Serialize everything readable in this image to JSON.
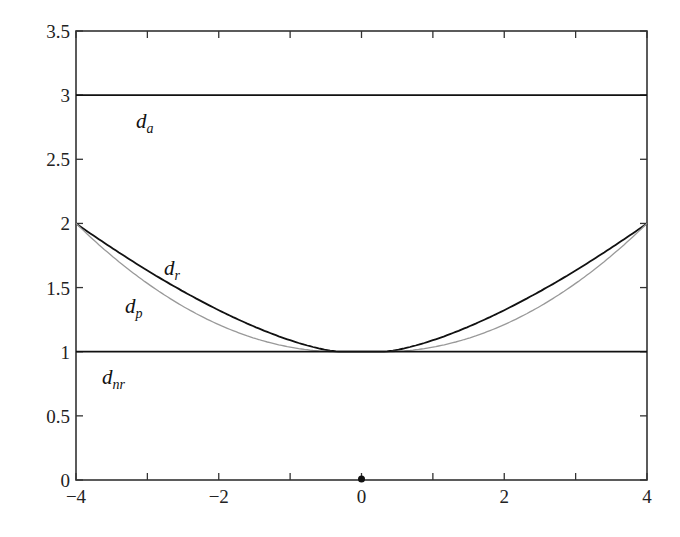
{
  "chart_data": {
    "type": "line",
    "title": "",
    "xlabel": "",
    "ylabel": "",
    "xlim": [
      -4,
      4
    ],
    "ylim": [
      0,
      3.5
    ],
    "grid": false,
    "legend": "none (inline curve labels)",
    "x_ticks": [
      -4,
      -2,
      0,
      2,
      4
    ],
    "x_tick_labels": [
      "−4",
      "−2",
      "0",
      "2",
      "4"
    ],
    "x_minor_ticks": [
      -3,
      -1,
      1,
      3
    ],
    "y_ticks": [
      0,
      0.5,
      1,
      1.5,
      2,
      2.5,
      3,
      3.5
    ],
    "y_tick_labels": [
      "0",
      "0.5",
      "1",
      "1.5",
      "2",
      "2.5",
      "3",
      "3.5"
    ],
    "series": [
      {
        "name": "d_a",
        "label_main": "d",
        "label_sub": "a",
        "color": "#111111",
        "x": [
          -4,
          4
        ],
        "y": [
          3,
          3
        ]
      },
      {
        "name": "d_r",
        "label_main": "d",
        "label_sub": "r",
        "color": "#111111",
        "x": [
          -4,
          -3,
          -2,
          -1,
          -0.3,
          0,
          0.3,
          1,
          2,
          3,
          4
        ],
        "y": [
          2.0,
          1.63,
          1.29,
          1.07,
          1.0,
          1.0,
          1.0,
          1.07,
          1.29,
          1.63,
          2.0
        ]
      },
      {
        "name": "d_p",
        "label_main": "d",
        "label_sub": "p",
        "color": "#999999",
        "x": [
          -4,
          -3,
          -2,
          -1,
          -0.3,
          0,
          0.3,
          1,
          2,
          3,
          4
        ],
        "y": [
          2.0,
          1.48,
          1.16,
          1.03,
          1.0,
          1.0,
          1.0,
          1.03,
          1.16,
          1.48,
          2.0
        ]
      },
      {
        "name": "d_nr",
        "label_main": "d",
        "label_sub": "nr",
        "color": "#111111",
        "x": [
          -4,
          4
        ],
        "y": [
          1,
          1
        ]
      }
    ],
    "annotations": [
      {
        "type": "point",
        "x": 0,
        "y": 0,
        "desc": "dot marker on x-axis at origin"
      }
    ]
  }
}
